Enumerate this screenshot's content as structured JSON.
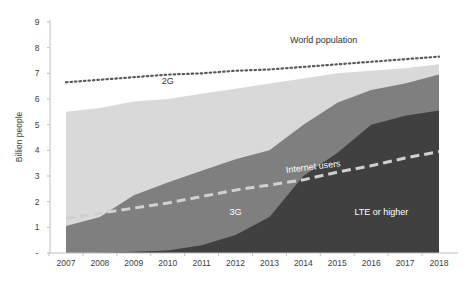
{
  "chart_data": {
    "type": "area",
    "title": "",
    "xlabel": "",
    "ylabel": "Billion people",
    "ylim": [
      0,
      9
    ],
    "yticks": [
      "",
      "1",
      "2",
      "3",
      "4",
      "5",
      "6",
      "7",
      "8",
      "9"
    ],
    "categories": [
      "2007",
      "2008",
      "2009",
      "2010",
      "2011",
      "2012",
      "2013",
      "2014",
      "2015",
      "2016",
      "2017",
      "2018"
    ],
    "stacked_tops": true,
    "series": [
      {
        "name": "2G",
        "kind": "area",
        "color": "#d9d9d9",
        "label_pos": [
          2010,
          6.6
        ],
        "values": [
          5.5,
          5.65,
          5.9,
          6.0,
          6.2,
          6.4,
          6.6,
          6.8,
          7.0,
          7.1,
          7.2,
          7.35
        ]
      },
      {
        "name": "3G",
        "kind": "area",
        "color": "#7f7f7f",
        "label_pos": [
          2012,
          1.5
        ],
        "values": [
          1.05,
          1.4,
          2.25,
          2.75,
          3.2,
          3.65,
          4.0,
          5.0,
          5.85,
          6.35,
          6.6,
          6.95
        ]
      },
      {
        "name": "LTE or higher",
        "kind": "area",
        "color": "#404040",
        "label_pos": [
          2016.3,
          1.5
        ],
        "values": [
          0,
          0,
          0.05,
          0.1,
          0.3,
          0.7,
          1.4,
          3.0,
          3.9,
          5.0,
          5.35,
          5.55
        ]
      },
      {
        "name": "World population",
        "kind": "dotted-line",
        "color": "#595959",
        "label_pos": [
          2014.6,
          8.2
        ],
        "values": [
          6.65,
          6.75,
          6.85,
          6.95,
          7.0,
          7.1,
          7.15,
          7.25,
          7.35,
          7.45,
          7.55,
          7.65
        ]
      },
      {
        "name": "Internet users",
        "kind": "dashed-line",
        "color": "#d0d0d0",
        "label_pos": [
          2014.3,
          3.25
        ],
        "values": [
          1.35,
          1.55,
          1.75,
          1.95,
          2.2,
          2.45,
          2.65,
          2.85,
          3.15,
          3.4,
          3.7,
          3.95
        ]
      }
    ],
    "grid": false,
    "legend": "inline labels"
  }
}
